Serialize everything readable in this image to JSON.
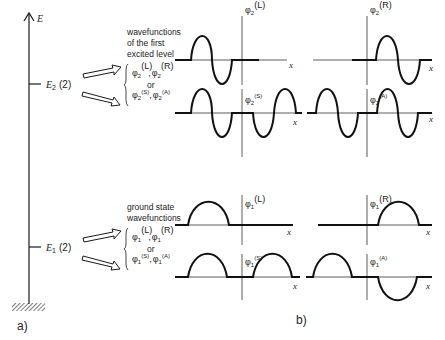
{
  "panel_a": {
    "label": "a)",
    "axis_label": "E",
    "levels": [
      {
        "symbol": "E",
        "sub": "2",
        "degeneracy": "(2)",
        "y": 84
      },
      {
        "symbol": "E",
        "sub": "1",
        "degeneracy": "(2)",
        "y": 247
      }
    ]
  },
  "annotations": {
    "excited_caption": [
      "wavefunctions",
      "of the first",
      "excited level"
    ],
    "ground_caption": [
      "ground state",
      "wavefunctions"
    ],
    "or": "or",
    "excited_pair_1": {
      "a": "φ",
      "a_sub": "2",
      "a_sup": "(L)",
      "b": "φ",
      "b_sub": "2",
      "b_sup": "(R)"
    },
    "excited_pair_2": {
      "a": "φ",
      "a_sub": "2",
      "a_sup": "(S)",
      "b": "φ",
      "b_sub": "2",
      "b_sup": "(A)"
    },
    "ground_pair_1": {
      "a": "φ",
      "a_sub": "1",
      "a_sup": "(L)",
      "b": "φ",
      "b_sub": "1",
      "b_sup": "(R)"
    },
    "ground_pair_2": {
      "a": "φ",
      "a_sub": "1",
      "a_sup": "(S)",
      "b": "φ",
      "b_sub": "1",
      "b_sup": "(A)"
    }
  },
  "panel_b": {
    "label": "b)",
    "x_label": "x",
    "plots": [
      {
        "id": "phi2-L",
        "name": "φ",
        "sub": "2",
        "sup": "(L)"
      },
      {
        "id": "phi2-R",
        "name": "φ",
        "sub": "2",
        "sup": "(R)"
      },
      {
        "id": "phi2-S",
        "name": "φ",
        "sub": "2",
        "sup": "(S)"
      },
      {
        "id": "phi2-A",
        "name": "φ",
        "sub": "2",
        "sup": "(A)"
      },
      {
        "id": "phi1-L",
        "name": "φ",
        "sub": "1",
        "sup": "(L)"
      },
      {
        "id": "phi1-R",
        "name": "φ",
        "sub": "1",
        "sup": "(R)"
      },
      {
        "id": "phi1-S",
        "name": "φ",
        "sub": "1",
        "sup": "(S)"
      },
      {
        "id": "phi1-A",
        "name": "φ",
        "sub": "1",
        "sup": "(A)"
      }
    ]
  },
  "colors": {
    "ink": "#1a1a1a",
    "background": "#ffffff"
  }
}
